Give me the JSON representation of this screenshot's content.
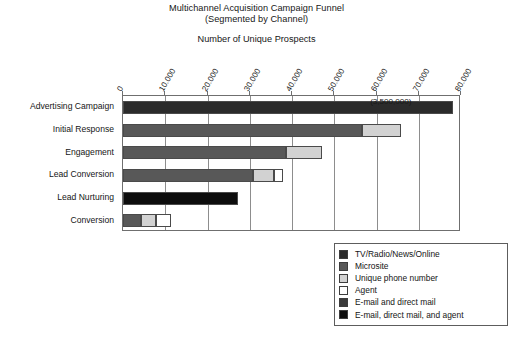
{
  "chart_data": {
    "type": "bar",
    "orientation": "horizontal",
    "stacked": true,
    "title": "Multichannel Acquisition Campaign Funnel",
    "subtitle_line2": "(Segmented by Channel)",
    "xlabel": "Number of Unique Prospects",
    "ylabel": "",
    "xlim": [
      0,
      80000
    ],
    "xticks": [
      0,
      10000,
      20000,
      30000,
      40000,
      50000,
      60000,
      70000,
      80000
    ],
    "xtick_labels": [
      "0",
      "10.000",
      "20.000",
      "30.000",
      "40.000",
      "50.000",
      "60.000",
      "70.000",
      "80.000"
    ],
    "grid": "vertical",
    "legend_position": "bottom-right",
    "categories": [
      "Advertising Campaign",
      "Initial Response",
      "Engagement",
      "Lead Conversion",
      "Lead Nurturing",
      "Conversion"
    ],
    "series": [
      {
        "name": "TV/Radio/News/Online",
        "color": "#2b2b2b",
        "values": [
          78000,
          0,
          0,
          0,
          0,
          0
        ]
      },
      {
        "name": "Microsite",
        "color": "#585858",
        "values": [
          0,
          56500,
          38500,
          30700,
          0,
          4300
        ]
      },
      {
        "name": "Unique phone number",
        "color": "#d2d2d2",
        "values": [
          0,
          9300,
          8500,
          5000,
          0,
          3500
        ]
      },
      {
        "name": "Agent",
        "color": "#ffffff",
        "values": [
          0,
          0,
          0,
          2200,
          0,
          3600
        ]
      },
      {
        "name": "E-mail and direct mail",
        "color": "#3a3a3a",
        "values": [
          0,
          0,
          0,
          0,
          0,
          0
        ]
      },
      {
        "name": "E-mail, direct mail, and agent",
        "color": "#0d0d0d",
        "values": [
          0,
          0,
          0,
          0,
          27200,
          0
        ]
      }
    ],
    "annotations": [
      {
        "text": "(3,500,000)",
        "x": 58500,
        "category": "Advertising Campaign"
      }
    ]
  },
  "legend": {
    "items": [
      {
        "label": "TV/Radio/News/Online",
        "color": "#2b2b2b"
      },
      {
        "label": "Microsite",
        "color": "#585858"
      },
      {
        "label": "Unique phone number",
        "color": "#d2d2d2"
      },
      {
        "label": "Agent",
        "color": "#ffffff"
      },
      {
        "label": "E-mail and direct mail",
        "color": "#3a3a3a"
      },
      {
        "label": "E-mail, direct mail, and agent",
        "color": "#0d0d0d"
      }
    ]
  },
  "footer": {
    "text": ""
  }
}
